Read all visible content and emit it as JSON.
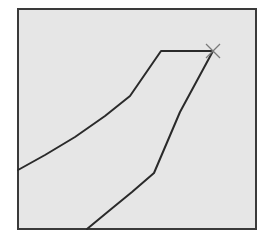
{
  "canvas": {
    "width": 268,
    "height": 245,
    "background": "#ffffff"
  },
  "frame": {
    "x": 18,
    "y": 9,
    "width": 238,
    "height": 220,
    "fill": "#e6e6e6",
    "stroke": "#3a3a3a",
    "stroke_width": 2
  },
  "upper_path": {
    "points": "18,170 45,155 75,137 105,116 130,96 161,51 213,51",
    "stroke": "#2a2a2a",
    "stroke_width": 2
  },
  "lower_path": {
    "points": "87,229 110,210 132,192 154,173 180,112 213,51",
    "stroke": "#2a2a2a",
    "stroke_width": 2
  },
  "marker": {
    "type": "x-cross",
    "cx": 213,
    "cy": 51,
    "size": 7,
    "stroke": "#7a7a7a",
    "stroke_width": 1.2
  }
}
